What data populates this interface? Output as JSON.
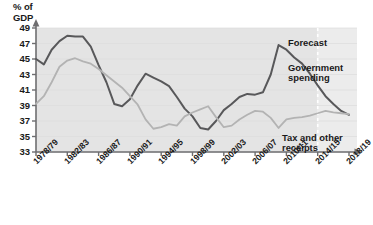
{
  "chart_data": {
    "type": "line",
    "title": "",
    "ylabel": "% of\nGDP",
    "xlabel": "",
    "ylim": [
      33,
      49
    ],
    "yticks": [
      49,
      47,
      45,
      43,
      41,
      39,
      37,
      35,
      33
    ],
    "grid": false,
    "legend_position": "inline-annotations",
    "x": [
      "1978/79",
      "1979/80",
      "1980/81",
      "1981/82",
      "1982/83",
      "1983/84",
      "1984/85",
      "1985/86",
      "1986/87",
      "1987/88",
      "1988/89",
      "1989/90",
      "1990/91",
      "1991/92",
      "1992/93",
      "1993/94",
      "1994/95",
      "1995/96",
      "1996/97",
      "1997/98",
      "1998/99",
      "1999/00",
      "2000/01",
      "2001/02",
      "2002/03",
      "2003/04",
      "2004/05",
      "2005/06",
      "2006/07",
      "2007/08",
      "2008/09",
      "2009/10",
      "2010/11",
      "2011/12",
      "2012/13",
      "2013/14",
      "2014/15",
      "2015/16",
      "2016/17",
      "2017/18",
      "2018/19"
    ],
    "xticks": [
      "1978/79",
      "1982/83",
      "1986/87",
      "1990/91",
      "1994/95",
      "1998/99",
      "2002/03",
      "2006/07",
      "2010/11",
      "2014/15",
      "2018/19"
    ],
    "series": [
      {
        "name": "Government spending",
        "color": "#58585a",
        "values": [
          45.0,
          44.3,
          46.2,
          47.3,
          48.0,
          47.9,
          47.9,
          46.6,
          44.2,
          42.0,
          39.2,
          38.9,
          39.8,
          41.6,
          43.1,
          42.6,
          42.1,
          41.5,
          40.1,
          38.6,
          37.6,
          36.1,
          35.9,
          37.0,
          38.4,
          39.2,
          40.1,
          40.5,
          40.4,
          40.7,
          43.0,
          46.8,
          46.2,
          45.2,
          44.4,
          43.1,
          41.6,
          40.2,
          39.2,
          38.3,
          37.8
        ]
      },
      {
        "name": "Tax and other receipts",
        "color": "#b3b3b3",
        "values": [
          39.2,
          40.2,
          42.0,
          44.0,
          44.8,
          45.1,
          44.7,
          44.4,
          43.7,
          42.9,
          42.1,
          41.3,
          40.2,
          39.1,
          37.2,
          36.0,
          36.2,
          36.6,
          36.4,
          37.6,
          38.1,
          38.5,
          38.9,
          37.5,
          36.2,
          36.4,
          37.2,
          37.8,
          38.3,
          38.2,
          37.4,
          36.1,
          37.2,
          37.4,
          37.5,
          37.7,
          38.0,
          38.3,
          38.1,
          38.0,
          37.9
        ]
      }
    ],
    "annotations": [
      {
        "text": "Forecast",
        "name": "forecast-label"
      },
      {
        "text": "Government\nspending",
        "name": "government-spending-label"
      },
      {
        "text": "Tax and other\nreceipts",
        "name": "tax-receipts-label"
      }
    ],
    "forecast_divider_x": "2014/15",
    "plot_background": "#e4e4e4",
    "forecast_background": "#ececec"
  }
}
